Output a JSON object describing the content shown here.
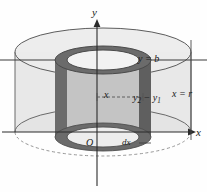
{
  "figure": {
    "type": "cylindrical-shell-diagram",
    "background_color": "#fefefe",
    "axes": {
      "y_axis_label": "y",
      "x_axis_label": "x",
      "origin_label": "O"
    },
    "labels": {
      "top_boundary": "y = b",
      "right_boundary": "x = r",
      "shell_height_base": "y",
      "shell_height_sub1": "2",
      "shell_height_minus": " − ",
      "shell_height_base2": "y",
      "shell_height_sub2": "1",
      "shell_radius": "x",
      "shell_thickness": "dx"
    },
    "colors": {
      "outer_cylinder_fill": "#e2e2e2",
      "outer_cylinder_stroke": "#5a5a5a",
      "shell_dark": "#6e6e6e",
      "shell_darker": "#585858",
      "shell_inner_fill": "#c9c9c9",
      "axis_stroke": "#2b2b2b",
      "dashed_stroke": "#777777",
      "text": "#1a1a1a"
    },
    "geometry": {
      "outer_center_x": 103,
      "outer_radius_x": 88,
      "outer_top_y": 52,
      "outer_bottom_y": 132,
      "outer_ellipse_ry": 24,
      "shell_outer_rx": 48,
      "shell_inner_rx": 36,
      "shell_ellipse_ry": 14,
      "shell_top_y": 60,
      "shell_bottom_y": 137
    }
  }
}
